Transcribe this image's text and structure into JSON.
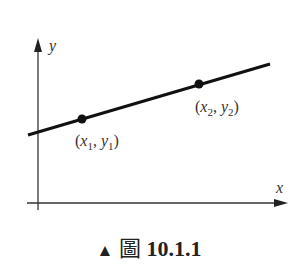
{
  "diagram": {
    "axes": {
      "x_label": "x",
      "y_label": "y"
    },
    "points": [
      {
        "name": "P1",
        "label_x": "x",
        "sub_x": "1",
        "label_y": "y",
        "sub_y": "1",
        "cx": 82,
        "cy": 119
      },
      {
        "name": "P2",
        "label_x": "x",
        "sub_x": "2",
        "label_y": "y",
        "sub_y": "2",
        "cx": 199,
        "cy": 84
      }
    ],
    "line": {
      "x1": 28,
      "y1": 135,
      "x2": 270,
      "y2": 64
    },
    "caption": {
      "marker": "▲",
      "word": "圖",
      "number": "10.1.1"
    }
  }
}
